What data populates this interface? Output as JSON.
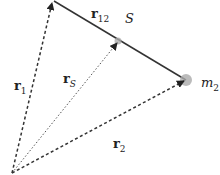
{
  "diagram": {
    "nodes": [
      {
        "id": "origin",
        "x": 12,
        "y": 173
      },
      {
        "id": "m1",
        "x": 52,
        "y": 1
      },
      {
        "id": "m2",
        "x": 186,
        "y": 80,
        "label": "m",
        "sub": "2"
      },
      {
        "id": "S",
        "x": 118,
        "y": 41,
        "label": "S"
      }
    ],
    "labels": {
      "r12": {
        "main": "r",
        "sub": "12"
      },
      "r1": {
        "main": "r",
        "sub": "1"
      },
      "rS": {
        "main": "r",
        "sub": "S"
      },
      "r2": {
        "main": "r",
        "sub": "2"
      },
      "S": "S",
      "m2": {
        "main": "m",
        "sub": "2"
      }
    },
    "colors": {
      "line": "#333333",
      "dot": "#aaaaaa"
    }
  }
}
